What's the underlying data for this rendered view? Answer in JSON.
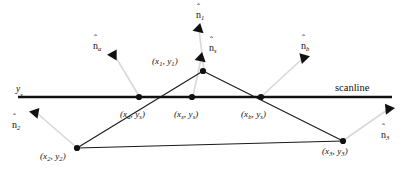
{
  "figure": {
    "width": 415,
    "height": 174,
    "background_color": "#ffffff",
    "ink_color": "#111111",
    "leader_color": "#d8d8d8",
    "scanline": {
      "label": "scanline",
      "axis_label_base": "y",
      "axis_label_sub": "s",
      "y_px": 97,
      "x_start": 18,
      "x_end": 392,
      "stroke_width": 2.6
    },
    "vertices": [
      {
        "name": "v1",
        "base": "(x",
        "sub1": "1",
        "mid": ", y",
        "sub2": "1",
        "close": ")",
        "x": 203,
        "y": 71,
        "label_x": 152,
        "label_y": 57
      },
      {
        "name": "v2",
        "base": "(x",
        "sub1": "2",
        "mid": ", y",
        "sub2": "2",
        "close": ")",
        "x": 77,
        "y": 148,
        "label_x": 40,
        "label_y": 152
      },
      {
        "name": "v3",
        "base": "(x",
        "sub1": "3",
        "mid": ", y",
        "sub2": "3",
        "close": ")",
        "x": 343,
        "y": 141,
        "label_x": 322,
        "label_y": 147
      }
    ],
    "scan_points": [
      {
        "name": "pa",
        "base": "(x",
        "sub1": "a",
        "mid": ", y",
        "sub2": "s",
        "close": ")",
        "x": 139,
        "y": 97,
        "label_x": 120,
        "label_y": 110
      },
      {
        "name": "ps",
        "base": "(x",
        "sub1": "s",
        "mid": ", y",
        "sub2": "s",
        "close": ")",
        "x": 192,
        "y": 97,
        "label_x": 174,
        "label_y": 110
      },
      {
        "name": "pb",
        "base": "(x",
        "sub1": "b",
        "mid": ", y",
        "sub2": "s",
        "close": ")",
        "x": 261,
        "y": 97,
        "label_x": 241,
        "label_y": 110
      }
    ],
    "normals": [
      {
        "name": "n1",
        "base": "n",
        "sub": "1",
        "label_x": 196,
        "label_y": 10,
        "tip_x": 199,
        "tip_y": 28,
        "tail_x": 204,
        "tail_y": 70,
        "angle_deg": 193
      },
      {
        "name": "ns",
        "base": "n",
        "sub": "s",
        "label_x": 209,
        "label_y": 43,
        "tip_x": 201,
        "tip_y": 57,
        "tail_x": 193,
        "tail_y": 96,
        "angle_deg": 192
      },
      {
        "name": "na",
        "base": "n",
        "sub": "a",
        "label_x": 93,
        "label_y": 41,
        "tip_x": 114,
        "tip_y": 54,
        "tail_x": 139,
        "tail_y": 96,
        "angle_deg": 211
      },
      {
        "name": "nb",
        "base": "n",
        "sub": "b",
        "label_x": 301,
        "label_y": 41,
        "tip_x": 303,
        "tip_y": 57,
        "tail_x": 262,
        "tail_y": 96,
        "angle_deg": 136
      },
      {
        "name": "n2",
        "base": "n",
        "sub": "2",
        "label_x": 12,
        "label_y": 120,
        "tip_x": 36,
        "tip_y": 112,
        "tail_x": 76,
        "tail_y": 147,
        "angle_deg": 221
      },
      {
        "name": "n3",
        "base": "n",
        "sub": "3",
        "label_x": 381,
        "label_y": 130,
        "tip_x": 388,
        "tip_y": 108,
        "tail_x": 344,
        "tail_y": 140,
        "angle_deg": 144
      }
    ],
    "edges": [
      {
        "name": "edge-v1-v2",
        "x1": 203,
        "y1": 71,
        "x2": 77,
        "y2": 148
      },
      {
        "name": "edge-v1-v3",
        "x1": 203,
        "y1": 71,
        "x2": 343,
        "y2": 141
      },
      {
        "name": "edge-v2-v3",
        "x1": 77,
        "y1": 148,
        "x2": 343,
        "y2": 141
      }
    ]
  }
}
